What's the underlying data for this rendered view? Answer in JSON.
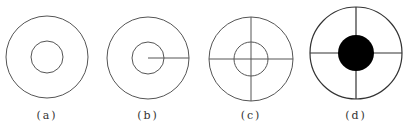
{
  "figures": [
    {
      "label": "(a)",
      "cx": 47,
      "cy": 57,
      "outer_r": 41,
      "inner_r": 16,
      "inner_filled": false,
      "lines": "none"
    },
    {
      "label": "(b)",
      "cx": 148,
      "cy": 58,
      "outer_r": 41,
      "inner_r": 16,
      "inner_filled": false,
      "lines": "radius-right"
    },
    {
      "label": "(c)",
      "cx": 251,
      "cy": 59,
      "outer_r": 42,
      "inner_r": 17,
      "inner_filled": false,
      "lines": "cross"
    },
    {
      "label": "(d)",
      "cx": 356,
      "cy": 53,
      "outer_r": 46,
      "inner_r": 18,
      "inner_filled": true,
      "lines": "cross"
    }
  ],
  "colors": {
    "stroke": "#555555",
    "fill": "#000000"
  }
}
